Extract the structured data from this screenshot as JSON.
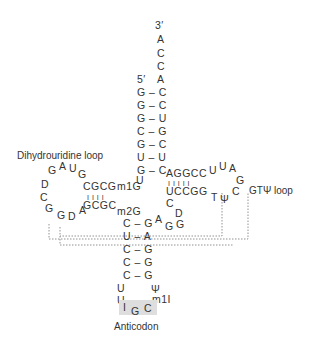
{
  "labels": {
    "dihydrouridine_loop": "Dihydrouridine loop",
    "gt_psi_loop": "GTΨ loop",
    "anticodon": "Anticodon"
  },
  "acceptor_stem": {
    "end_3": "3′",
    "end_5": "5′",
    "overhang": [
      "A",
      "C",
      "C",
      "A"
    ],
    "pairs": [
      "G – C",
      "G – C",
      "G – U",
      "C – G",
      "G – C",
      "U – U",
      "G – C"
    ]
  },
  "d_arm": {
    "top_strand": "CGCG",
    "bottom_strand": "GCGC",
    "bars": "I I I I",
    "loop": [
      "G",
      "A",
      "U",
      "G",
      "D",
      "C",
      "G",
      "G",
      "D",
      "A"
    ],
    "modified": "m1G",
    "connector": "U"
  },
  "t_arm": {
    "top_strand": "AGGCC",
    "bottom_strand": "UCCGG",
    "bars": "I I I I I",
    "loop": [
      "U",
      "U",
      "A",
      "G",
      "C",
      "T",
      "Ψ"
    ],
    "variable_loop": [
      "C",
      "D",
      "G",
      "G",
      "A"
    ]
  },
  "anticodon_arm": {
    "modified": "m2G",
    "pairs": [
      "C – G",
      "U – A",
      "C – G",
      "C – G",
      "C – G"
    ],
    "loop_left": [
      "U",
      "U"
    ],
    "loop_right": [
      "Ψ",
      "m1I"
    ],
    "anticodon": [
      "I",
      "G",
      "C"
    ]
  }
}
